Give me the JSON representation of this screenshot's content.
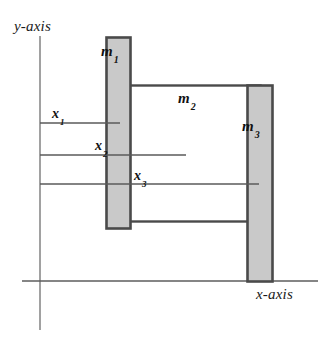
{
  "figure": {
    "kind": "mechanical-schematic",
    "background_color": "#ffffff",
    "width": 335,
    "height": 340,
    "axes": {
      "y_axis_label": "y-axis",
      "x_axis_label": "x-axis",
      "axis_line_color": "#6f6f6f",
      "y_axis_line": {
        "x": 40,
        "y_top": 36,
        "y_bottom": 330
      },
      "x_axis_line": {
        "y": 281,
        "x_left": 22,
        "x_right": 318
      }
    },
    "bodies": [
      {
        "name": "m1",
        "label": "m",
        "subscript": "1",
        "shape": "vertical-bar",
        "x": 106,
        "y": 37,
        "width": 24,
        "height": 191,
        "fill": "#c9c9c9",
        "stroke": "#4a4a4a"
      },
      {
        "name": "m2",
        "label": "m",
        "subscript": "2",
        "shape": "open-rectangle",
        "x": 124,
        "y": 85,
        "width": 136,
        "height": 136,
        "fill": "#ffffff",
        "stroke": "#4a4a4a"
      },
      {
        "name": "m3",
        "label": "m",
        "subscript": "3",
        "shape": "vertical-bar",
        "x": 247,
        "y": 85,
        "width": 25,
        "height": 196,
        "fill": "#c9c9c9",
        "stroke": "#4a4a4a"
      }
    ],
    "coordinates": [
      {
        "name": "x1",
        "label": "x",
        "subscript": "1",
        "line_y": 123,
        "line_x_start": 40,
        "line_x_end": 120,
        "line_color": "#5a5a5a",
        "describes": "displacement of m1"
      },
      {
        "name": "x2",
        "label": "x",
        "subscript": "2",
        "line_y": 155,
        "line_x_start": 40,
        "line_x_end": 186,
        "line_color": "#5a5a5a",
        "describes": "displacement of m2"
      },
      {
        "name": "x3",
        "label": "x",
        "subscript": "3",
        "line_y": 184,
        "line_x_start": 40,
        "line_x_end": 259,
        "line_color": "#5a5a5a",
        "describes": "displacement of m3"
      }
    ]
  }
}
